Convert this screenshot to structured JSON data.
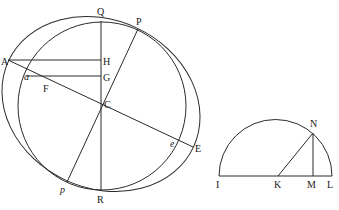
{
  "figure": {
    "left": {
      "labels": {
        "Q": "Q",
        "P": "P",
        "A": "A",
        "a": "a",
        "H": "H",
        "G": "G",
        "F": "F",
        "C": "C",
        "e": "e",
        "E": "E",
        "p": "p",
        "R": "R"
      },
      "curves": [
        "circle",
        "tilted-ellipse"
      ],
      "lines": [
        "QR",
        "Pp",
        "AE",
        "AH",
        "aG"
      ]
    },
    "right": {
      "labels": {
        "N": "N",
        "I": "I",
        "K": "K",
        "M": "M",
        "L": "L"
      },
      "curves": [
        "semicircle"
      ],
      "lines": [
        "IL",
        "KN",
        "NM"
      ]
    }
  }
}
